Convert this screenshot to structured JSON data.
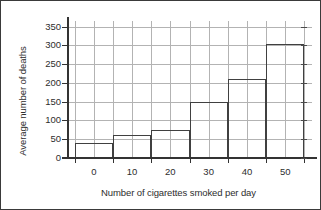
{
  "chart_data": {
    "type": "bar",
    "title": "",
    "xlabel": "Number of cigarettes smoked per day",
    "ylabel": "Average number of deaths",
    "categories": [
      "0",
      "10",
      "20",
      "30",
      "40",
      "50"
    ],
    "bin_edges": [
      -5,
      5,
      15,
      25,
      35,
      45,
      55
    ],
    "values": [
      40,
      60,
      75,
      148,
      210,
      303
    ],
    "xlim": [
      -7,
      57
    ],
    "ylim": [
      0,
      365
    ],
    "xticks": [
      0,
      10,
      20,
      30,
      40,
      50
    ],
    "yticks": [
      0,
      50,
      100,
      150,
      200,
      250,
      300,
      350
    ],
    "ytick_labels": [
      "0",
      "50",
      "100",
      "150",
      "200",
      "250",
      "300",
      "350"
    ],
    "xtick_labels": [
      "0",
      "10",
      "20",
      "30",
      "40",
      "50"
    ],
    "grid": true,
    "grid_x_step": 5,
    "grid_y_step": 50,
    "legend": null,
    "bar_edge_color": "#404040",
    "bar_fill_color": "#ffffff",
    "grid_color": "#b3b3b3",
    "axis_color": "#333333",
    "text_color": "#2d2d2d",
    "background_color": "#ffffff",
    "border_color": "#3a3a3a"
  }
}
